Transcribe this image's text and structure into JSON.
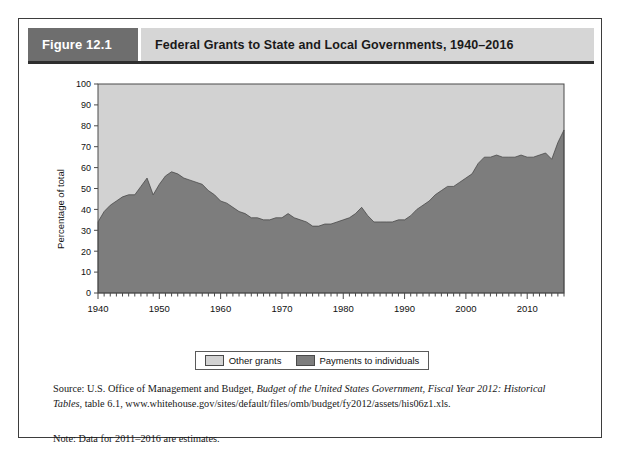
{
  "figure": {
    "number_label": "Figure 12.1",
    "title": "Federal Grants to State and Local Governments, 1940–2016"
  },
  "legend": {
    "items": [
      {
        "label": "Other grants",
        "color": "#d2d2d2",
        "swatch_name": "other-grants-swatch"
      },
      {
        "label": "Payments to individuals",
        "color": "#7d7d7d",
        "swatch_name": "payments-to-individuals-swatch"
      }
    ]
  },
  "footnotes": {
    "source_prefix": "Source: U.S. Office of Management and Budget, ",
    "source_italic_1": "Budget of the United States Government, Fiscal Year 2012: Historical Tables",
    "source_suffix": ", table 6.1, www.whitehouse.gov/sites/default/files/omb/budget/fy2012/assets/his06z1.xls.",
    "note": "Note: Data for 2011–2016 are estimates."
  },
  "chart_data": {
    "type": "area",
    "title": "Federal Grants to State and Local Governments, 1940–2016",
    "xlabel": "",
    "ylabel": "Percentage of total",
    "xlim": [
      1940,
      2016
    ],
    "ylim": [
      0,
      100
    ],
    "yticks": [
      0,
      10,
      20,
      30,
      40,
      50,
      60,
      70,
      80,
      90,
      100
    ],
    "xticks": [
      1940,
      1950,
      1960,
      1970,
      1980,
      1990,
      2000,
      2010
    ],
    "minor_xtick_interval": 1,
    "grid": false,
    "stacked": true,
    "stack_total": 100,
    "legend_position": "bottom",
    "colors": {
      "payments_to_individuals": "#7d7d7d",
      "other_grants": "#d2d2d2",
      "plot_border": "#4a4a4a",
      "axis_text": "#111111"
    },
    "x": [
      1940,
      1941,
      1942,
      1943,
      1944,
      1945,
      1946,
      1947,
      1948,
      1949,
      1950,
      1951,
      1952,
      1953,
      1954,
      1955,
      1956,
      1957,
      1958,
      1959,
      1960,
      1961,
      1962,
      1963,
      1964,
      1965,
      1966,
      1967,
      1968,
      1969,
      1970,
      1971,
      1972,
      1973,
      1974,
      1975,
      1976,
      1977,
      1978,
      1979,
      1980,
      1981,
      1982,
      1983,
      1984,
      1985,
      1986,
      1987,
      1988,
      1989,
      1990,
      1991,
      1992,
      1993,
      1994,
      1995,
      1996,
      1997,
      1998,
      1999,
      2000,
      2001,
      2002,
      2003,
      2004,
      2005,
      2006,
      2007,
      2008,
      2009,
      2010,
      2011,
      2012,
      2013,
      2014,
      2015,
      2016
    ],
    "series": [
      {
        "name": "Payments to individuals",
        "color": "#7d7d7d",
        "values": [
          34,
          39,
          42,
          44,
          46,
          47,
          47,
          51,
          55,
          47,
          52,
          56,
          58,
          57,
          55,
          54,
          53,
          52,
          49,
          47,
          44,
          43,
          41,
          39,
          38,
          36,
          36,
          35,
          35,
          36,
          36,
          38,
          36,
          35,
          34,
          32,
          32,
          33,
          33,
          34,
          35,
          36,
          38,
          41,
          37,
          34,
          34,
          34,
          34,
          35,
          35,
          37,
          40,
          42,
          44,
          47,
          49,
          51,
          51,
          53,
          55,
          57,
          62,
          65,
          65,
          66,
          65,
          65,
          65,
          66,
          65,
          65,
          66,
          67,
          64,
          72,
          78
        ]
      },
      {
        "name": "Other grants",
        "color": "#d2d2d2",
        "values": [
          66,
          61,
          58,
          56,
          54,
          53,
          53,
          49,
          45,
          53,
          48,
          44,
          42,
          43,
          45,
          46,
          47,
          48,
          51,
          53,
          56,
          57,
          59,
          61,
          62,
          64,
          64,
          65,
          65,
          64,
          64,
          62,
          64,
          65,
          66,
          68,
          68,
          67,
          67,
          66,
          65,
          64,
          62,
          59,
          63,
          66,
          66,
          66,
          66,
          65,
          65,
          63,
          60,
          58,
          56,
          53,
          51,
          49,
          49,
          47,
          45,
          43,
          38,
          35,
          35,
          34,
          35,
          35,
          35,
          34,
          35,
          35,
          34,
          33,
          36,
          28,
          22
        ]
      }
    ]
  }
}
